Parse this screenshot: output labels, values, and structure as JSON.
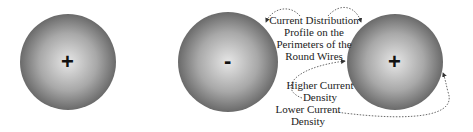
{
  "wires": [
    {
      "id": "wire-1",
      "sign": "+",
      "cx": 68,
      "cy": 62,
      "r": 48
    },
    {
      "id": "wire-2",
      "sign": "-",
      "cx": 228,
      "cy": 62,
      "r": 50
    },
    {
      "id": "wire-3",
      "sign": "+",
      "cx": 395,
      "cy": 62,
      "r": 48
    }
  ],
  "labels": {
    "profile": [
      "Current Distribution",
      "Profile on the",
      "Perimeters of the",
      "Round Wires"
    ],
    "higher": [
      "Higher Current",
      "Density"
    ],
    "lower": [
      "Lower Current",
      "Density"
    ]
  },
  "colors": {
    "wire_center": "#e4e4e4",
    "wire_edge": "#6e6e6e",
    "arrow": "#444444"
  }
}
